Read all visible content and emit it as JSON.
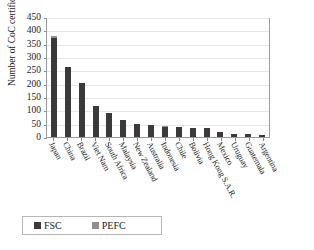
{
  "chart_data": {
    "type": "bar",
    "title": "",
    "xlabel": "",
    "ylabel": "Number of CoC certificates",
    "ylim": [
      0,
      450
    ],
    "yticks": [
      0,
      50,
      100,
      150,
      200,
      250,
      300,
      350,
      400,
      450
    ],
    "grid": true,
    "stacked": true,
    "legend_position": "bottom-left",
    "categories": [
      "Japan",
      "China",
      "Brazil",
      "Viet Nam",
      "South Africa",
      "Malaysia",
      "New Zealand",
      "Australia",
      "Indonesia",
      "Chile",
      "Bolivia",
      "Hong Kong S.A.R.",
      "Mexico",
      "Uruguay",
      "Guatemala",
      "Argentina"
    ],
    "series": [
      {
        "name": "FSC",
        "color": "#3a3a3a",
        "values": [
          372,
          262,
          203,
          118,
          90,
          62,
          50,
          45,
          38,
          38,
          35,
          32,
          20,
          12,
          10,
          8
        ]
      },
      {
        "name": "PEFC",
        "color": "#8f8f8f",
        "values": [
          8,
          0,
          0,
          0,
          0,
          0,
          0,
          0,
          4,
          0,
          0,
          0,
          0,
          0,
          0,
          0
        ]
      }
    ]
  },
  "legend": {
    "items": [
      {
        "label": "FSC",
        "swatch": "fsc-swatch"
      },
      {
        "label": "PEFC",
        "swatch": "pefc-swatch"
      }
    ]
  }
}
